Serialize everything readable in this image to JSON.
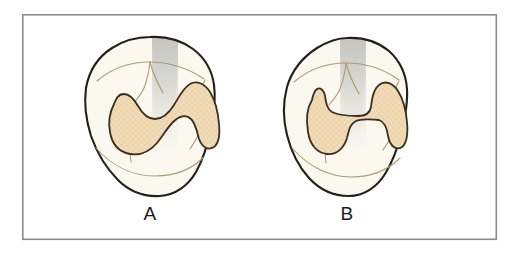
{
  "figure": {
    "type": "line-illustration",
    "canvas": {
      "width": 512,
      "height": 255,
      "background": "#ffffff"
    },
    "frame": {
      "name": "figure-border",
      "x": 22,
      "y": 14,
      "width": 475,
      "height": 226,
      "stroke": "#8b8b8b",
      "stroke_width": 1.6,
      "fill": "#ffffff"
    },
    "palette": {
      "tooth_outline": "#231f1c",
      "tooth_fill": "#faf8ef",
      "tooth_shadow_grey": "#c9c9c5",
      "groove_line": "#b09a72",
      "inlay_fill": "#f2dcb8",
      "inlay_hatch": "#e6c79a",
      "inlay_outline": "#3a2f22",
      "label_text": "#1a1a1a",
      "frame_stroke": "#8b8b8b"
    },
    "panels": [
      {
        "id": "panel-a",
        "label": "A",
        "tooth": {
          "name": "molar-crown-a",
          "view": "occlusal",
          "center_x": 150,
          "center_y": 117,
          "bounds": {
            "x": 85,
            "y": 37,
            "width": 130,
            "height": 160
          }
        },
        "preparation": {
          "name": "cavity-outline-a",
          "shape": "curved hourglass band (mesio-occluso-distal, S-curved isthmus)",
          "fill": "#f2dcb8",
          "texture": "fine cross-hatch stipple"
        },
        "grooves": 5
      },
      {
        "id": "panel-b",
        "label": "B",
        "tooth": {
          "name": "molar-crown-b",
          "view": "occlusal",
          "center_x": 347,
          "center_y": 117,
          "bounds": {
            "x": 285,
            "y": 38,
            "width": 123,
            "height": 159
          }
        },
        "preparation": {
          "name": "cavity-outline-b",
          "shape": "dumbbell / H shape with narrow straight isthmus",
          "fill": "#f2dcb8",
          "texture": "fine cross-hatch stipple"
        },
        "grooves": 5
      }
    ]
  }
}
